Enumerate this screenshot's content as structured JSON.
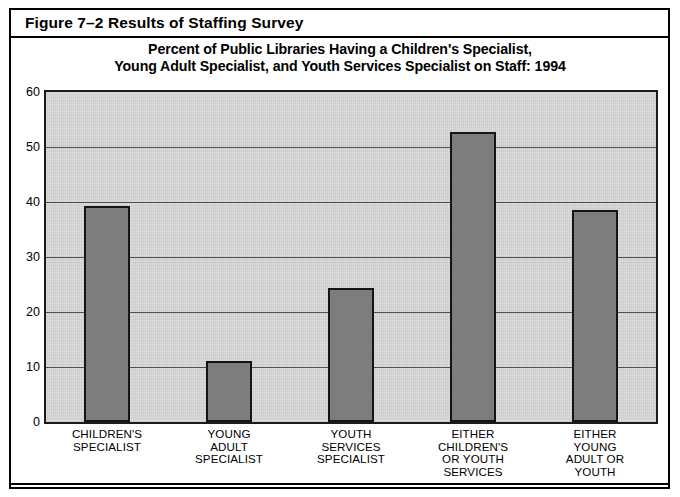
{
  "figure": {
    "header_label": "Figure 7–2 Results of Staffing Survey"
  },
  "chart_data": {
    "type": "bar",
    "title_line1": "Percent of Public Libraries Having a Children's Specialist,",
    "title_line2": "Young Adult Specialist, and Youth Services Specialist on Staff: 1994",
    "title": "Percent of Public Libraries Having a Children's Specialist, Young Adult Specialist, and Youth Services Specialist on Staff: 1994",
    "categories": [
      "CHILDREN'S SPECIALIST",
      "YOUNG ADULT SPECIALIST",
      "YOUTH SERVICES SPECIALIST",
      "EITHER CHILDREN'S OR YOUTH SERVICES",
      "EITHER YOUNG ADULT OR YOUTH"
    ],
    "category_lines": [
      [
        "CHILDREN'S",
        "SPECIALIST"
      ],
      [
        "YOUNG",
        "ADULT",
        "SPECIALIST"
      ],
      [
        "YOUTH",
        "SERVICES",
        "SPECIALIST"
      ],
      [
        "EITHER",
        "CHILDREN'S",
        "OR YOUTH",
        "SERVICES"
      ],
      [
        "EITHER",
        "YOUNG",
        "ADULT OR",
        "YOUTH"
      ]
    ],
    "values": [
      39.3,
      11.1,
      24.3,
      52.7,
      38.6
    ],
    "xlabel": "",
    "ylabel": "",
    "ylim": [
      0,
      60
    ],
    "yticks": [
      0,
      10,
      20,
      30,
      40,
      50,
      60
    ],
    "ytick_labels": [
      "0",
      "10",
      "20",
      "30",
      "40",
      "50",
      "60"
    ],
    "grid": true,
    "legend": false,
    "colors": {
      "bar_fill": "#7d7d7d",
      "bar_edge": "#141414",
      "plot_background": "#d0d0d0",
      "gridline": "#3a3a3a",
      "text": "#000000",
      "frame": "#000000"
    }
  }
}
